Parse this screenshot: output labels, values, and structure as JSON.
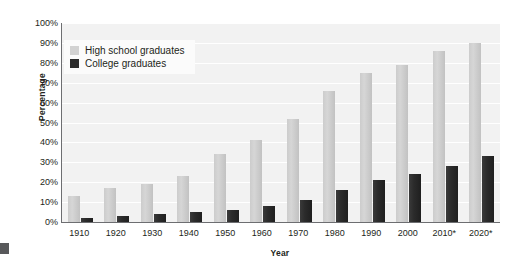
{
  "chart_data": {
    "type": "bar",
    "title": "",
    "xlabel": "Year",
    "ylabel": "Percentage",
    "ylim": [
      0,
      100
    ],
    "ytick_labels": [
      "100%",
      "90%",
      "80%",
      "70%",
      "60%",
      "50%",
      "40%",
      "30%",
      "20%",
      "10%",
      "0%"
    ],
    "ytick_values": [
      100,
      90,
      80,
      70,
      60,
      50,
      40,
      30,
      20,
      10,
      0
    ],
    "grid": true,
    "legend_position": "top-left",
    "categories": [
      "1910",
      "1920",
      "1930",
      "1940",
      "1950",
      "1960",
      "1970",
      "1980",
      "1990",
      "2000",
      "2010*",
      "2020*"
    ],
    "series": [
      {
        "name": "High school graduates",
        "color": "#d2d2d2",
        "values": [
          13,
          17,
          19,
          23,
          34,
          41,
          52,
          66,
          75,
          79,
          86,
          90
        ]
      },
      {
        "name": "College graduates",
        "color": "#2b2b2b",
        "values": [
          2,
          3,
          4,
          5,
          6,
          8,
          11,
          16,
          21,
          24,
          28,
          33
        ]
      }
    ]
  },
  "axes": {
    "y_title": "Percentage",
    "x_title": "Year"
  },
  "legend": {
    "items": [
      {
        "label": "High school graduates",
        "swatch": "hs"
      },
      {
        "label": "College graduates",
        "swatch": "col"
      }
    ]
  },
  "colors": {
    "plot_background": "#f2f2f2",
    "gridline": "#ffffff",
    "axis_line": "#6d6e71",
    "high_school_bar": "#d2d2d2",
    "college_bar": "#2b2b2b",
    "text": "#231f20"
  }
}
